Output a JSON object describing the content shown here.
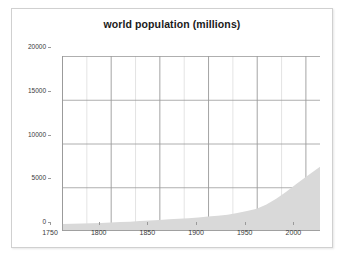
{
  "chart_data": {
    "type": "area",
    "title": "world population (millions)",
    "xlabel": "",
    "ylabel": "",
    "xlim": [
      1750,
      2015
    ],
    "ylim": [
      0,
      20000
    ],
    "grid": true,
    "legend": false,
    "x_ticks": [
      1750,
      1800,
      1850,
      1900,
      1950,
      2000
    ],
    "x_minor_step": 25,
    "y_ticks": [
      0,
      5000,
      10000,
      15000,
      20000
    ],
    "series": [
      {
        "name": "world population",
        "fill_color": "#d9d9d9",
        "x": [
          1750,
          1760,
          1770,
          1780,
          1790,
          1800,
          1810,
          1820,
          1830,
          1840,
          1850,
          1860,
          1870,
          1880,
          1890,
          1900,
          1910,
          1920,
          1930,
          1940,
          1950,
          1960,
          1970,
          1980,
          1990,
          2000,
          2010,
          2015
        ],
        "values": [
          791,
          820,
          850,
          880,
          920,
          978,
          1020,
          1070,
          1130,
          1200,
          1262,
          1330,
          1400,
          1470,
          1550,
          1650,
          1750,
          1860,
          2070,
          2300,
          2530,
          3030,
          3700,
          4450,
          5320,
          6145,
          6930,
          7350
        ]
      }
    ]
  },
  "colors": {
    "area_fill": "#d9d9d9",
    "grid_minor": "#d8d8d8",
    "grid_major": "#9a9a9a",
    "axis": "#9a9a9a",
    "text": "#3a3a3a",
    "title": "#1a1a1a",
    "card_border": "#d0d0d0",
    "background": "#ffffff"
  },
  "axes": {
    "y_labels": [
      "20000",
      "15000",
      "10000",
      "5000",
      "0"
    ],
    "x_labels": [
      "1750",
      "1800",
      "1850",
      "1900",
      "1950",
      "2000"
    ]
  }
}
